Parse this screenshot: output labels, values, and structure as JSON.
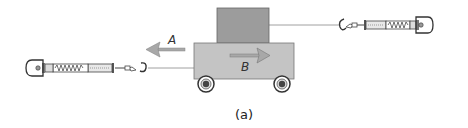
{
  "figure": {
    "caption": "(a)",
    "labels": {
      "arrow_top": "A",
      "arrow_bottom": "B"
    },
    "colors": {
      "block": "#9c9c9c",
      "cart": "#c4c4c4",
      "outline": "#666666",
      "arrow": "#a0a0a0",
      "string": "#888888"
    },
    "parts": [
      {
        "name": "block",
        "description": "Block resting on top of the cart"
      },
      {
        "name": "cart",
        "description": "Cart with two wheels"
      },
      {
        "name": "left-spring-scale",
        "description": "Spring balance pulling cart to the left"
      },
      {
        "name": "right-spring-scale",
        "description": "Spring balance pulling block to the right"
      }
    ]
  }
}
